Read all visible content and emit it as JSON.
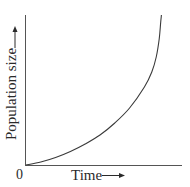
{
  "chart_data": {
    "type": "line",
    "title": "",
    "xlabel": "Time",
    "ylabel": "Population size",
    "origin_label": "0",
    "x_arrow": true,
    "y_arrow": true,
    "grid": false,
    "legend": null,
    "x": [
      0,
      10,
      20,
      30,
      40,
      50,
      60,
      70,
      80,
      85,
      88,
      90,
      91,
      91.5
    ],
    "series": [
      {
        "name": "Population size",
        "values": [
          0,
          2,
          5,
          9,
          14,
          20,
          28,
          38,
          52,
          62,
          72,
          84,
          95,
          100
        ]
      }
    ],
    "xlim": [
      0,
      100
    ],
    "ylim": [
      0,
      100
    ],
    "tick_labels": []
  },
  "colors": {
    "axis": "#555555",
    "curve": "#3a3a3a",
    "text": "#2a2a2a",
    "background": "#ffffff"
  }
}
